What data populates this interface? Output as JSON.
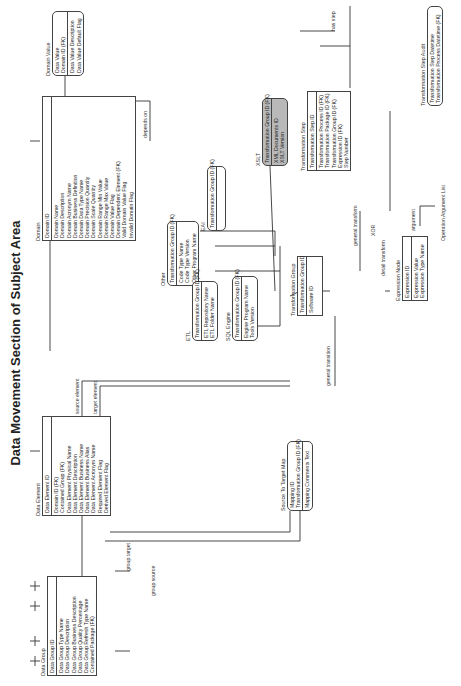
{
  "title": "Data Movement Section of Subject Area",
  "entities": {
    "data_group": {
      "name": "Data Group",
      "pk": [
        "Data Group ID"
      ],
      "attrs": [
        "Data Group Type Name",
        "Data Group Description",
        "Data Group Business Description",
        "Data Group Quality Percentage",
        "Data Group Refresh Type Name",
        "Contained Package (FK)"
      ]
    },
    "data_element": {
      "name": "Data Element",
      "pk": [
        "Data Element ID"
      ],
      "attrs": [
        "Domain ID (FK)",
        "Contained Group (FK)",
        "Data Element Physical Name",
        "Data Element Description",
        "Data Element Business Name",
        "Data Element Business Alias",
        "Data Element Acronym Name",
        "Required Element Flag",
        "Derived Element Flag"
      ]
    },
    "domain": {
      "name": "Domain",
      "pk": [
        "Domain ID"
      ],
      "attrs": [
        "Domain Name",
        "Domain Description",
        "Domain Acronym Name",
        "Domain Business Definition",
        "Domain Data Type Name",
        "Domain Precision Quantity",
        "Domain Scale Quantity",
        "Domain Range Min Value",
        "Domain Range Max Value",
        "Domain Value Flag",
        "Domain Dependent Element (FK)",
        "Valid Domain Value Flag",
        "Invalid Domain Flag"
      ]
    },
    "domain_value": {
      "name": "Domain Value",
      "pk": [
        "Data Value",
        "Domain ID (FK)"
      ],
      "attrs": [
        "Data Value Description",
        "Data Value Default Flag"
      ]
    },
    "other": {
      "name": "Other",
      "pk": [
        "Transformation Group ID (FK)"
      ],
      "attrs": [
        "Code Type Name",
        "Code Type Version",
        "Other Program Name"
      ]
    },
    "etl": {
      "name": "ETL",
      "pk": [
        "Transformation Group ID (FK)"
      ],
      "attrs": [
        "ETL Repository Name",
        "ETL Folder Name"
      ]
    },
    "sql_engine": {
      "name": "SQL Engine",
      "pk": [
        "Transformation Group ID (FK)"
      ],
      "attrs": [
        "Engine Program Name",
        "Tools Version"
      ]
    },
    "eai": {
      "name": "EAI",
      "pk": [
        "Transformation Group ID (FK)"
      ],
      "attrs": []
    },
    "xslt": {
      "name": "XSLT",
      "pk": [
        "Transformation Group ID (FK)"
      ],
      "attrs": [
        "XML Documents ID",
        "XSLT Version"
      ]
    },
    "transformation_group": {
      "name": "Transformation Group",
      "pk": [
        "Transformation Group ID"
      ],
      "attrs": [
        "Software ID"
      ]
    },
    "source_to_target_map": {
      "name": "Source To Target Map",
      "pk": [
        "Mapping ID",
        "Transformation Group ID (FK)"
      ],
      "attrs": [
        "Mapping Comments Text"
      ]
    },
    "transformation_step": {
      "name": "Transformation Step",
      "pk": [
        "Transformation Step ID"
      ],
      "attrs": [
        "Transformation Process ID (FK)",
        "Transformation Package ID (FK)",
        "Transformation Group ID (FK)",
        "Expression ID (FK)",
        "Step Number"
      ]
    },
    "expression_node": {
      "name": "Expression Node",
      "pk": [
        "Expression ID"
      ],
      "attrs": [
        "Expression Value",
        "Expression Type Name"
      ]
    },
    "transformation_step_audit": {
      "name": "Transformation Step Audit",
      "pk": [],
      "attrs": [
        "Transformation Step Datetime",
        "Transformation Process Datetime (FK)"
      ]
    },
    "operation_argument_list": {
      "name": "Operation Argument List"
    }
  },
  "relationships": {
    "source_element": "source element",
    "target_element": "target element",
    "group_target": "group target",
    "group_source": "group source",
    "depends_on": "depends on",
    "general_transition": "general transition",
    "general_transform": "general transform",
    "detail_transform": "detail transform",
    "xor": "XOR",
    "has_step": "has step",
    "argument": "argument"
  }
}
